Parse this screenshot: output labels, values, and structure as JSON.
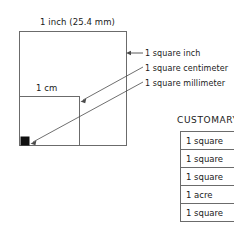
{
  "diagram": {
    "top_dimension_label": "1 inch (25.4 mm)",
    "inner_dimension_label": "1 cm",
    "callouts": [
      {
        "id": "square-inch",
        "label": "1 square inch"
      },
      {
        "id": "square-centimeter",
        "label": "1 square centimeter"
      },
      {
        "id": "square-millimeter",
        "label": "1 square millimeter"
      }
    ],
    "shapes": {
      "inch_square_name": "1 square inch outline",
      "cm_square_name": "1 square centimeter outline",
      "mm_square_name": "1 square millimeter filled"
    },
    "colors": {
      "ink": "#1a1a1a",
      "line": "#6b6b6b",
      "fill": "#111111",
      "background": "#ffffff"
    }
  },
  "customary": {
    "heading": "CUSTOMARY",
    "rows": [
      {
        "label": "1 square"
      },
      {
        "label": "1 square"
      },
      {
        "label": "1 square"
      },
      {
        "label": "1 acre"
      },
      {
        "label": "1 square"
      }
    ]
  }
}
